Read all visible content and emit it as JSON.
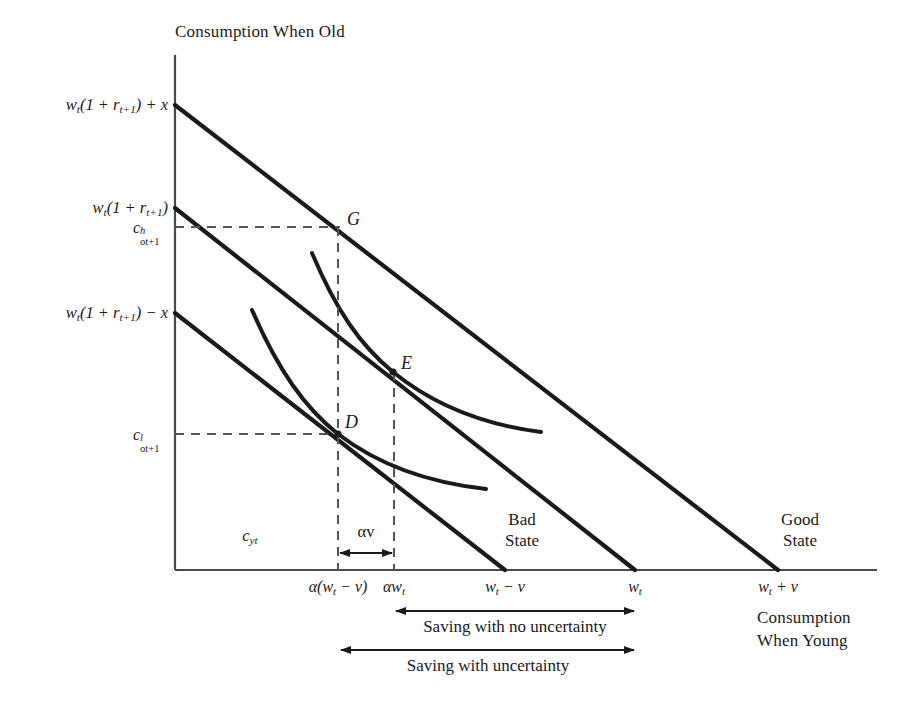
{
  "figure": {
    "width": 909,
    "height": 706,
    "background": "#ffffff",
    "ink": "#1a1a1a",
    "dash_color": "#555555"
  },
  "axes": {
    "y_axis_title": "Consumption When Old",
    "x_axis_title_line1": "Consumption",
    "x_axis_title_line2": "When Young",
    "origin_px": [
      175,
      570
    ],
    "x_axis_end_px": [
      877,
      570
    ],
    "y_axis_top_px": [
      175,
      55
    ]
  },
  "y_intercept_labels": [
    {
      "id": "high",
      "text_html": "w<sub>t</sub>(1 + r<sub>t+1</sub>) + x",
      "y_px": 105
    },
    {
      "id": "middle",
      "text_html": "w<sub>t</sub>(1 + r<sub>t+1</sub>)",
      "y_px": 208
    },
    {
      "id": "low",
      "text_html": "w<sub>t</sub>(1 + r<sub>t+1</sub>) &minus; x",
      "y_px": 313
    }
  ],
  "y_dashed_labels": [
    {
      "id": "c_high",
      "base": "c",
      "sup": "h",
      "sub": "ot+1",
      "y_px": 227
    },
    {
      "id": "c_low",
      "base": "c",
      "sup": "l",
      "sub": "ot+1",
      "y_px": 434
    }
  ],
  "x_tick_labels": [
    {
      "id": "alpha-w-minus-v",
      "text_html": "&alpha;(w<sub>t</sub> &minus; v)",
      "x_px": 338
    },
    {
      "id": "alpha-w",
      "text_html": "&alpha;w<sub>t</sub>",
      "x_px": 394
    },
    {
      "id": "w-minus-v",
      "text_html": "w<sub>t</sub> &minus; v",
      "x_px": 505
    },
    {
      "id": "w",
      "text_html": "w<sub>t</sub>",
      "x_px": 635
    },
    {
      "id": "w-plus-v",
      "text_html": "w<sub>t</sub> + v",
      "x_px": 778
    }
  ],
  "interior_labels": [
    {
      "id": "c-young",
      "text_html": "c<sub>yt</sub>",
      "x_px": 250,
      "y_px": 536
    },
    {
      "id": "alpha-v",
      "text_html": "&alpha;v",
      "x_px": 366,
      "y_px": 532
    }
  ],
  "points": [
    {
      "id": "G",
      "label": "G",
      "x_px": 340,
      "y_px": 227
    },
    {
      "id": "E",
      "label": "E",
      "x_px": 393,
      "y_px": 372
    },
    {
      "id": "D",
      "label": "D",
      "x_px": 338,
      "y_px": 434
    }
  ],
  "state_labels": [
    {
      "id": "bad",
      "line1": "Bad",
      "line2": "State",
      "x_px": 522,
      "y_px": 520
    },
    {
      "id": "good",
      "line1": "Good",
      "line2": "State",
      "x_px": 800,
      "y_px": 520
    }
  ],
  "bracket_labels": [
    {
      "id": "saving-no-uncertainty",
      "text": "Saving with no uncertainty",
      "x_from_px": 395,
      "x_to_px": 635,
      "y_px": 611
    },
    {
      "id": "saving-with-uncertainty",
      "text": "Saving with uncertainty",
      "x_from_px": 340,
      "x_to_px": 635,
      "y_px": 650
    }
  ],
  "chart_data": {
    "type": "line",
    "title": "Consumption When Old",
    "xlabel": "Consumption When Young",
    "ylabel": "Consumption When Old",
    "grid": false,
    "legend": "none",
    "budget_lines": [
      {
        "name": "w_t(1+r_t+1) + x",
        "state": "Good State",
        "y_intercept_px": 105,
        "x_intercept_px": 778
      },
      {
        "name": "w_t(1+r_t+1)",
        "state": "Certainty",
        "y_intercept_px": 208,
        "x_intercept_px": 635
      },
      {
        "name": "w_t(1+r_t+1) - x",
        "state": "Bad State",
        "y_intercept_px": 313,
        "x_intercept_px": 505
      }
    ],
    "indifference_curves": [
      {
        "name": "upper",
        "tangent_point": "E",
        "start_px": [
          312,
          253
        ],
        "end_px": [
          541,
          432
        ]
      },
      {
        "name": "lower",
        "tangent_point": "D",
        "start_px": [
          252,
          310
        ],
        "end_px": [
          486,
          489
        ]
      }
    ],
    "equilibrium_points": [
      {
        "label": "G",
        "px": [
          340,
          227
        ],
        "note": "good-state consumption c^h_ot+1 at alpha(w_t - v)"
      },
      {
        "label": "E",
        "px": [
          393,
          372
        ],
        "note": "certainty tangency at alpha w_t"
      },
      {
        "label": "D",
        "px": [
          338,
          434
        ],
        "note": "bad-state consumption c^l_ot+1 at alpha(w_t - v)"
      }
    ]
  }
}
